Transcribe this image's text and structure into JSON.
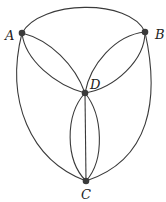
{
  "diagram": {
    "type": "multigraph",
    "nodes": [
      {
        "id": "A",
        "label": "A",
        "x": 22,
        "y": 33,
        "lx": 5,
        "ly": 40
      },
      {
        "id": "B",
        "label": "B",
        "x": 145,
        "y": 32,
        "lx": 155,
        "ly": 39
      },
      {
        "id": "D",
        "label": "D",
        "x": 85,
        "y": 93,
        "lx": 90,
        "ly": 89
      },
      {
        "id": "C",
        "label": "C",
        "x": 86,
        "y": 181,
        "lx": 81,
        "ly": 199
      }
    ],
    "edges": [
      {
        "from": "A",
        "to": "B",
        "kind": "top-arc"
      },
      {
        "from": "A",
        "to": "D",
        "kind": "lens-upper"
      },
      {
        "from": "A",
        "to": "D",
        "kind": "lens-lower"
      },
      {
        "from": "B",
        "to": "D",
        "kind": "lens-upper"
      },
      {
        "from": "B",
        "to": "D",
        "kind": "lens-lower"
      },
      {
        "from": "D",
        "to": "C",
        "kind": "curve-left"
      },
      {
        "from": "D",
        "to": "C",
        "kind": "straight"
      },
      {
        "from": "D",
        "to": "C",
        "kind": "curve-right"
      },
      {
        "from": "A",
        "to": "C",
        "kind": "outer-left"
      },
      {
        "from": "B",
        "to": "C",
        "kind": "outer-right"
      }
    ],
    "colors": {
      "stroke": "#3a3a3a",
      "node": "#3a3a3a"
    }
  }
}
